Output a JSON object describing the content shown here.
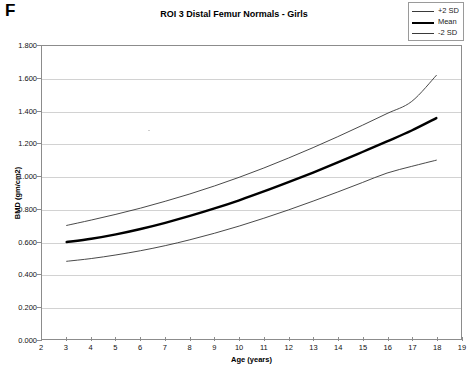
{
  "panel": {
    "letter": "F"
  },
  "chart_data": {
    "type": "line",
    "title": "ROI 3 Distal Femur Normals - Girls",
    "xlabel": "Age (years)",
    "ylabel": "BMD (gm/cm2)",
    "xlim": [
      2,
      19
    ],
    "ylim": [
      0.0,
      1.8
    ],
    "grid": "horizontal",
    "legend_position": "top-right",
    "xticks": [
      "2",
      "3",
      "4",
      "5",
      "6",
      "7",
      "8",
      "9",
      "10",
      "11",
      "12",
      "13",
      "14",
      "15",
      "16",
      "17",
      "18",
      "19"
    ],
    "xtick_values": [
      2,
      3,
      4,
      5,
      6,
      7,
      8,
      9,
      10,
      11,
      12,
      13,
      14,
      15,
      16,
      17,
      18,
      19
    ],
    "yticks": [
      "0.000",
      "0.200",
      "0.400",
      "0.600",
      "0.800",
      "1.000",
      "1.200",
      "1.400",
      "1.600",
      "1.800"
    ],
    "ytick_values": [
      0.0,
      0.2,
      0.4,
      0.6,
      0.8,
      1.0,
      1.2,
      1.4,
      1.6,
      1.8
    ],
    "x": [
      3,
      4,
      5,
      6,
      7,
      8,
      9,
      10,
      11,
      12,
      13,
      14,
      15,
      16,
      17,
      18
    ],
    "series": [
      {
        "name": "+2 SD",
        "style": "thin",
        "color": "#333333",
        "values": [
          0.7,
          0.733,
          0.768,
          0.806,
          0.848,
          0.893,
          0.942,
          0.995,
          1.052,
          1.113,
          1.177,
          1.244,
          1.314,
          1.386,
          1.46,
          1.62
        ]
      },
      {
        "name": "Mean",
        "style": "thick",
        "color": "#000000",
        "values": [
          0.598,
          0.618,
          0.645,
          0.678,
          0.716,
          0.758,
          0.804,
          0.854,
          0.908,
          0.965,
          1.024,
          1.086,
          1.15,
          1.215,
          1.282,
          1.358
        ]
      },
      {
        "name": "-2 SD",
        "style": "thin",
        "color": "#333333",
        "values": [
          0.48,
          0.497,
          0.519,
          0.545,
          0.576,
          0.612,
          0.652,
          0.696,
          0.744,
          0.795,
          0.849,
          0.905,
          0.963,
          1.021,
          1.062,
          1.1
        ]
      }
    ]
  },
  "legend": {
    "items": [
      {
        "label": "+2 SD",
        "style": "thin"
      },
      {
        "label": "Mean",
        "style": "thick"
      },
      {
        "label": "-2 SD",
        "style": "thin"
      }
    ]
  }
}
